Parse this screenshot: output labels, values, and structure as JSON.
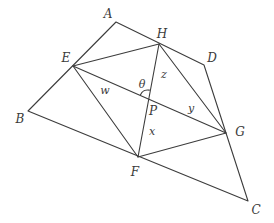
{
  "diagram": {
    "stroke_color": "#3c3c3c",
    "points": {
      "A": [
        116,
        22
      ],
      "B": [
        28,
        111
      ],
      "C": [
        248,
        201
      ],
      "D": [
        204,
        65
      ],
      "E": [
        73,
        66
      ],
      "F": [
        138,
        157
      ],
      "G": [
        226,
        133
      ],
      "H": [
        159,
        44
      ],
      "P": [
        148,
        98
      ]
    },
    "vertex_labels": [
      {
        "text": "A",
        "x": 108,
        "y": 14
      },
      {
        "text": "H",
        "x": 162,
        "y": 34
      },
      {
        "text": "D",
        "x": 212,
        "y": 58
      },
      {
        "text": "E",
        "x": 66,
        "y": 58
      },
      {
        "text": "B",
        "x": 20,
        "y": 119
      },
      {
        "text": "F",
        "x": 135,
        "y": 172
      },
      {
        "text": "G",
        "x": 240,
        "y": 132
      },
      {
        "text": "C",
        "x": 256,
        "y": 210
      },
      {
        "text": "P",
        "x": 153,
        "y": 111
      }
    ],
    "segment_labels": [
      {
        "text": "w",
        "x": 105,
        "y": 90
      },
      {
        "text": "z",
        "x": 164,
        "y": 74
      },
      {
        "text": "y",
        "x": 191,
        "y": 108
      },
      {
        "text": "x",
        "x": 152,
        "y": 131
      },
      {
        "text": "θ",
        "x": 142,
        "y": 84
      }
    ]
  }
}
